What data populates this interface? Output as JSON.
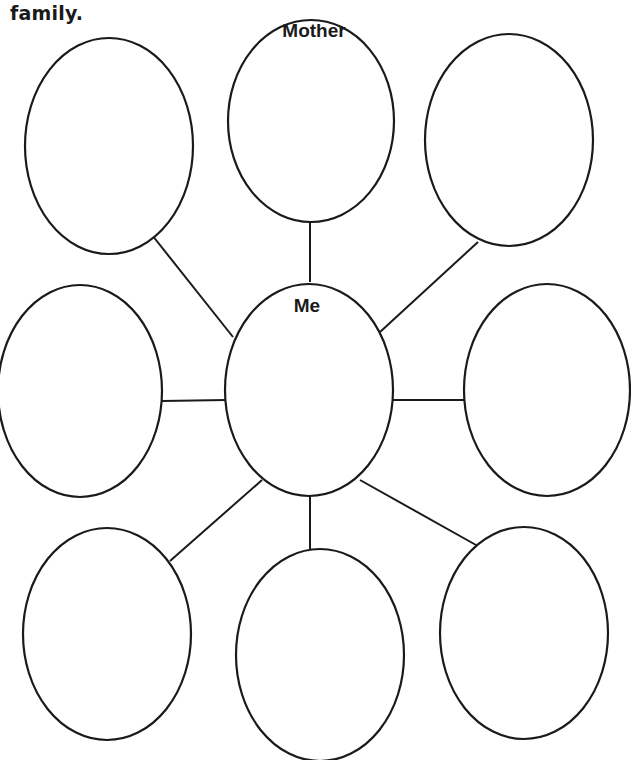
{
  "worksheet": {
    "title_fragment": "family."
  },
  "web": {
    "center": {
      "id": "me",
      "label": "Me"
    },
    "bubbles": [
      {
        "id": "top-left",
        "label": ""
      },
      {
        "id": "top-middle",
        "label": "Mother"
      },
      {
        "id": "top-right",
        "label": ""
      },
      {
        "id": "middle-left",
        "label": ""
      },
      {
        "id": "middle-right",
        "label": ""
      },
      {
        "id": "bottom-left",
        "label": ""
      },
      {
        "id": "bottom-middle",
        "label": ""
      },
      {
        "id": "bottom-right",
        "label": ""
      }
    ]
  }
}
